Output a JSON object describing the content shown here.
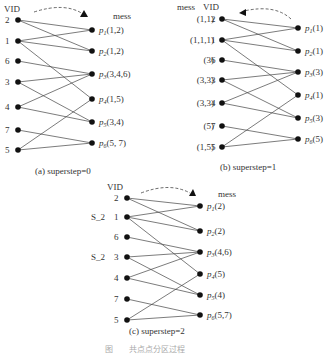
{
  "figure_caption": "图　　共点点分区过程",
  "panels": [
    {
      "id": "a",
      "caption": "(a)  superstep=0",
      "vid_header": "VID",
      "mess_header": "mess",
      "left_nodes": [
        {
          "vid": "2",
          "prefix": ""
        },
        {
          "vid": "1",
          "prefix": ""
        },
        {
          "vid": "6",
          "prefix": ""
        },
        {
          "vid": "3",
          "prefix": ""
        },
        {
          "vid": "4",
          "prefix": ""
        },
        {
          "vid": "7",
          "prefix": ""
        },
        {
          "vid": "5",
          "prefix": ""
        }
      ],
      "right_nodes": [
        {
          "p": "p",
          "sub": "1",
          "mess": "(1,2)"
        },
        {
          "p": "p",
          "sub": "2",
          "mess": "(1,2)"
        },
        {
          "p": "p",
          "sub": "3",
          "mess": "(3,4,6)"
        },
        {
          "p": "p",
          "sub": "4",
          "mess": "(1,5)"
        },
        {
          "p": "p",
          "sub": "5",
          "mess": "(3,4)"
        },
        {
          "p": "p",
          "sub": "6",
          "mess": "(5, 7)"
        }
      ],
      "arrow_direction": "left-to-right"
    },
    {
      "id": "b",
      "caption": "(b)  superstep=1",
      "vid_header": "VID",
      "mess_header": "mess",
      "left_nodes": [
        {
          "vid": "2",
          "prefix": "(1,1)"
        },
        {
          "vid": "1",
          "prefix": "(1,1,1)"
        },
        {
          "vid": "6",
          "prefix": "(3)"
        },
        {
          "vid": "3",
          "prefix": "(3,3)"
        },
        {
          "vid": "4",
          "prefix": "(3,3)"
        },
        {
          "vid": "7",
          "prefix": "(5)"
        },
        {
          "vid": "5",
          "prefix": "(1,5)"
        }
      ],
      "right_nodes": [
        {
          "p": "p",
          "sub": "1",
          "mess": "(1)"
        },
        {
          "p": "p",
          "sub": "2",
          "mess": "(1)"
        },
        {
          "p": "p",
          "sub": "3",
          "mess": "(3)"
        },
        {
          "p": "p",
          "sub": "4",
          "mess": "(1)"
        },
        {
          "p": "p",
          "sub": "5",
          "mess": "(3)"
        },
        {
          "p": "p",
          "sub": "6",
          "mess": "(5)"
        }
      ],
      "arrow_direction": "right-to-left"
    },
    {
      "id": "c",
      "caption": "(c)  superstep=2",
      "vid_header": "VID",
      "mess_header": "mess",
      "left_nodes": [
        {
          "vid": "2",
          "prefix": ""
        },
        {
          "vid": "1",
          "prefix": "S_2"
        },
        {
          "vid": "6",
          "prefix": ""
        },
        {
          "vid": "3",
          "prefix": "S_2"
        },
        {
          "vid": "4",
          "prefix": ""
        },
        {
          "vid": "7",
          "prefix": ""
        },
        {
          "vid": "5",
          "prefix": ""
        }
      ],
      "right_nodes": [
        {
          "p": "p",
          "sub": "1",
          "mess": "(2)"
        },
        {
          "p": "p",
          "sub": "2",
          "mess": "(2)"
        },
        {
          "p": "p",
          "sub": "3",
          "mess": "(4,6)"
        },
        {
          "p": "p",
          "sub": "4",
          "mess": "(5)"
        },
        {
          "p": "p",
          "sub": "5",
          "mess": "(4)"
        },
        {
          "p": "p",
          "sub": "6",
          "mess": "(5,7)"
        }
      ],
      "arrow_direction": "left-to-right"
    }
  ],
  "edges": [
    [
      "2",
      "p1"
    ],
    [
      "2",
      "p2"
    ],
    [
      "1",
      "p1"
    ],
    [
      "1",
      "p2"
    ],
    [
      "1",
      "p4"
    ],
    [
      "6",
      "p3"
    ],
    [
      "3",
      "p3"
    ],
    [
      "3",
      "p5"
    ],
    [
      "4",
      "p3"
    ],
    [
      "4",
      "p5"
    ],
    [
      "7",
      "p6"
    ],
    [
      "5",
      "p4"
    ],
    [
      "5",
      "p6"
    ]
  ]
}
